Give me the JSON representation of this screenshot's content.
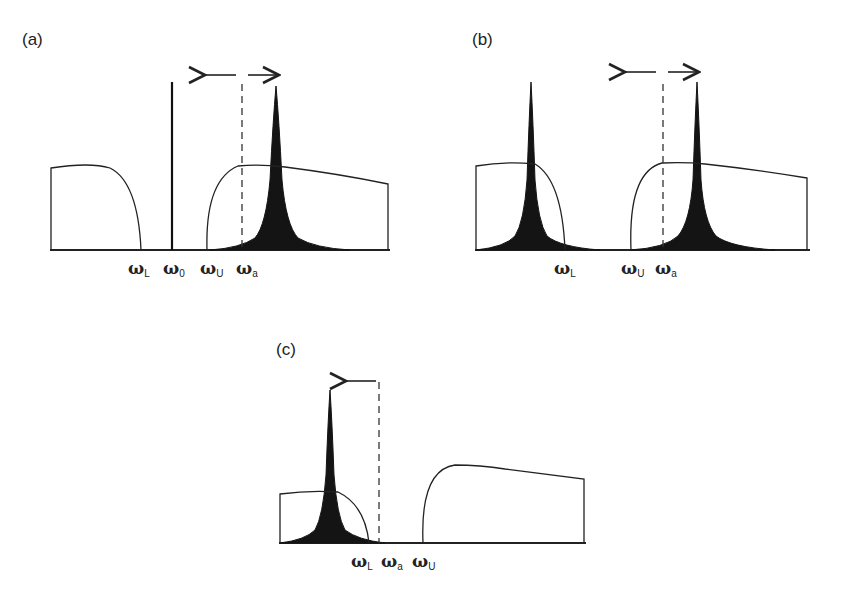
{
  "figure": {
    "panels": [
      {
        "id": "a",
        "label": "(a)",
        "freq_labels": [
          {
            "symbol": "ω",
            "sub": "L"
          },
          {
            "symbol": "ω",
            "sub": "0"
          },
          {
            "symbol": "ω",
            "sub": "U"
          },
          {
            "symbol": "ω",
            "sub": "a"
          }
        ],
        "arrow": "double-headed (left and right)",
        "peaks": 1
      },
      {
        "id": "b",
        "label": "(b)",
        "freq_labels": [
          {
            "symbol": "ω",
            "sub": "L"
          },
          {
            "symbol": "ω",
            "sub": "U"
          },
          {
            "symbol": "ω",
            "sub": "a"
          }
        ],
        "arrow": "double-headed (left and right)",
        "peaks": 2
      },
      {
        "id": "c",
        "label": "(c)",
        "freq_labels": [
          {
            "symbol": "ω",
            "sub": "L"
          },
          {
            "symbol": "ω",
            "sub": "a"
          },
          {
            "symbol": "ω",
            "sub": "U"
          }
        ],
        "arrow": "left-pointing",
        "peaks": 1
      }
    ],
    "colors": {
      "line": "#222222",
      "peak_fill": "#141414",
      "background": "#ffffff"
    }
  }
}
